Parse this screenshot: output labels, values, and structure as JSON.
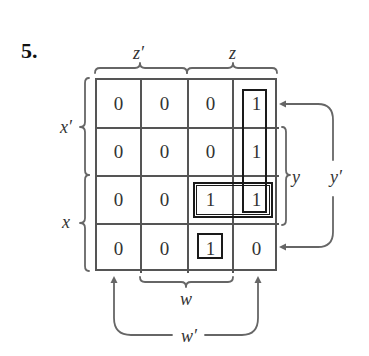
{
  "problem": {
    "number": "5."
  },
  "kmap": {
    "top_labels": {
      "left": "z′",
      "right": "z"
    },
    "left_labels": {
      "top": "x′",
      "bottom": "x"
    },
    "right_labels": {
      "inner": "y",
      "outer": "y′"
    },
    "bottom_labels": {
      "inner": "w",
      "outer": "w′"
    },
    "rows": [
      [
        "0",
        "0",
        "0",
        "1"
      ],
      [
        "0",
        "0",
        "0",
        "1"
      ],
      [
        "0",
        "0",
        "1",
        "1"
      ],
      [
        "0",
        "0",
        "1",
        "0"
      ]
    ],
    "loops": [
      {
        "name": "vertical-group",
        "cells": [
          [
            0,
            3
          ],
          [
            1,
            3
          ],
          [
            2,
            3
          ]
        ]
      },
      {
        "name": "horizontal-pair",
        "cells": [
          [
            2,
            2
          ],
          [
            2,
            3
          ]
        ]
      },
      {
        "name": "single-cell",
        "cells": [
          [
            3,
            2
          ]
        ]
      }
    ],
    "colors": {
      "grid_line": "#555555",
      "loop_line": "#1a1a1a",
      "annotation": "#666666",
      "text": "#333333"
    }
  }
}
